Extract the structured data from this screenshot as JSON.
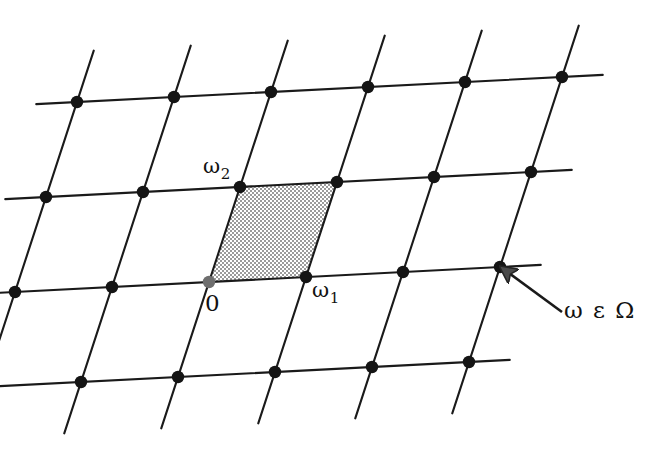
{
  "figure": {
    "kind": "lattice-diagram",
    "background_color": "#ffffff",
    "line_color": "#1a1a1a",
    "node_color": "#141414",
    "origin_node_color": "#6e6e6e",
    "shading_color": "#9a9a9a"
  },
  "labels": {
    "omega1": {
      "base": "ω",
      "sub": "1"
    },
    "omega2": {
      "base": "ω",
      "sub": "2"
    },
    "origin": {
      "base": "0",
      "sub": ""
    },
    "membership": {
      "base": "ω ε Ω",
      "sub": ""
    }
  },
  "chart_data": {
    "type": "scatter",
    "title": "",
    "xlabel": "",
    "ylabel": "",
    "grid": true,
    "legend": null,
    "xlim": [
      0,
      647
    ],
    "ylim": [
      460,
      0
    ],
    "lattice": {
      "origin": [
        209,
        282
      ],
      "basis_vectors": {
        "omega1": [
          97,
          -5
        ],
        "omega2": [
          31,
          -95
        ]
      },
      "i_range": [
        -2,
        3
      ],
      "j_range": [
        -1,
        2
      ],
      "node_radius": 6.2,
      "line_overshoot": 0.42
    },
    "fundamental_cell": {
      "shaded": true,
      "corners": [
        [
          209,
          282
        ],
        [
          306,
          277
        ],
        [
          337,
          182
        ],
        [
          240,
          187
        ]
      ],
      "fill_pattern": "fine-dot-stipple"
    },
    "annotation": {
      "text": "ω ε Ω",
      "arrow_tip": [
        502,
        268
      ],
      "arrow_tail": [
        562,
        312
      ],
      "target_node": [
        498,
        262
      ]
    },
    "point_labels": [
      {
        "text": "0",
        "point": [
          209,
          282
        ]
      },
      {
        "text": "ω₁",
        "point": [
          306,
          277
        ]
      },
      {
        "text": "ω₂",
        "point": [
          240,
          187
        ]
      }
    ]
  }
}
